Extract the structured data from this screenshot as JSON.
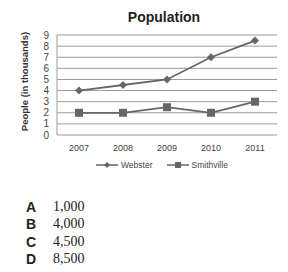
{
  "chart_data": {
    "type": "line",
    "title": "Population",
    "xlabel": "",
    "ylabel": "People (in thousands)",
    "categories": [
      "2007",
      "2008",
      "2009",
      "2010",
      "2011"
    ],
    "series": [
      {
        "name": "Webster",
        "marker": "diamond",
        "values": [
          4,
          4.5,
          5,
          7,
          8.5
        ]
      },
      {
        "name": "Smithville",
        "marker": "square",
        "values": [
          2,
          2,
          2.5,
          2,
          3
        ]
      }
    ],
    "ylim": [
      0,
      9
    ],
    "yticks": [
      0,
      1,
      2,
      3,
      4,
      5,
      6,
      7,
      8,
      9
    ],
    "grid": true,
    "legend_position": "bottom"
  },
  "answers": [
    {
      "letter": "A",
      "value": "1,000"
    },
    {
      "letter": "B",
      "value": "4,000"
    },
    {
      "letter": "C",
      "value": "4,500"
    },
    {
      "letter": "D",
      "value": "8,500"
    }
  ]
}
